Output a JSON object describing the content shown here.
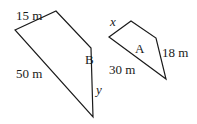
{
  "diagram": {
    "type": "similar-quadrilaterals",
    "shapes": [
      {
        "name": "B",
        "vertices": [
          [
            15,
            30
          ],
          [
            56,
            11
          ],
          [
            91,
            48
          ],
          [
            93,
            117
          ]
        ],
        "label_pos": [
          85,
          64
        ],
        "side_labels": [
          {
            "text": "15 m",
            "pos": [
              16,
              20
            ]
          },
          {
            "text": "50 m",
            "pos": [
              16,
              78
            ]
          },
          {
            "text": "y",
            "pos": [
              96,
              94
            ],
            "italic": true
          }
        ]
      },
      {
        "name": "A",
        "vertices": [
          [
            109,
            37
          ],
          [
            131,
            21
          ],
          [
            156,
            38
          ],
          [
            166,
            79
          ]
        ],
        "label_pos": [
          135,
          53
        ],
        "side_labels": [
          {
            "text": "x",
            "pos": [
              110,
              26
            ],
            "italic": true
          },
          {
            "text": "18 m",
            "pos": [
              162,
              57
            ]
          },
          {
            "text": "30 m",
            "pos": [
              109,
              74
            ]
          }
        ]
      }
    ]
  }
}
